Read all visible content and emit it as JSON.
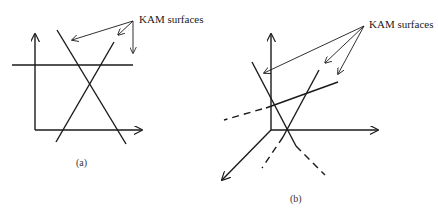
{
  "panel_a": {
    "annotation": "KAM surfaces",
    "caption": "(a)"
  },
  "panel_b": {
    "annotation": "KAM surfaces",
    "caption": "(b)"
  },
  "colors": {
    "line": "#1a1a1a",
    "background": "#ffffff"
  }
}
